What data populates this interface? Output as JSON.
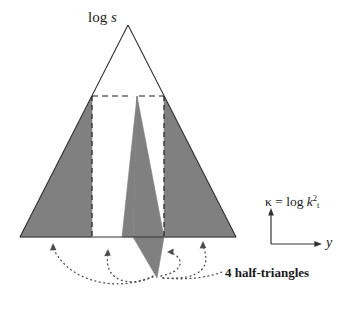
{
  "figure": {
    "title_label": "log s",
    "title_label_parts": {
      "prefix": "log ",
      "variable": "s"
    },
    "vertical_axis_label": {
      "symbol": "κ",
      "equals": " = log ",
      "base": "k",
      "subscript": "t",
      "superscript": "2"
    },
    "horizontal_axis_label": "y",
    "annotation": "4 half-triangles",
    "colors": {
      "shaded_fill": "#808080",
      "outline": "#333333",
      "dashed": "#1a1a1a",
      "dotted": "#4d4d4d",
      "background": "#ffffff"
    },
    "geometry": {
      "apex": [
        128,
        25
      ],
      "base_left": [
        20,
        237
      ],
      "base_right": [
        236,
        237
      ],
      "dashed_horizontal_y": 96,
      "dashed_vertical_left_x": 92,
      "dashed_vertical_right_x": 164,
      "sliver_top": [
        137,
        96
      ],
      "sliver_bottom": [
        157,
        278
      ]
    },
    "shapes": {
      "left_half_triangle": "left shaded half-triangle",
      "right_half_triangle": "right shaded half-triangle",
      "center_left_sliver": "center-left shaded sliver",
      "center_right_sliver": "center-right shaded sliver"
    },
    "arcs": {
      "outer_left": "dotted arc from lower apex to left half-triangle base",
      "inner_left": "dotted arc from lower apex to center-left sliver base",
      "inner_right": "dotted arc from lower apex to center-right sliver base",
      "outer_right": "dotted arc from lower apex to right half-triangle base"
    }
  }
}
